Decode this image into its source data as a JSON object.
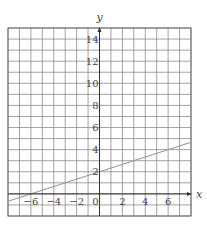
{
  "chart_data": {
    "type": "line",
    "title": "",
    "xlabel": "x",
    "ylabel": "y",
    "xlim": [
      -8,
      8
    ],
    "ylim": [
      -2,
      15
    ],
    "grid": true,
    "grid_step": 1,
    "x_ticks": [
      -6,
      -4,
      -2,
      0,
      2,
      4,
      6
    ],
    "x_tick_labels": [
      "−6",
      "−4",
      "−2",
      "0",
      "2",
      "4",
      "6"
    ],
    "y_ticks": [
      2,
      4,
      6,
      8,
      10,
      12,
      14
    ],
    "y_tick_labels": [
      "2",
      "4",
      "6",
      "8",
      "10",
      "12",
      "14"
    ],
    "series": [
      {
        "name": "y = x/3 + 2",
        "slope": 0.3333,
        "intercept": 2,
        "x": [
          -8,
          8
        ],
        "values": [
          -0.667,
          4.667
        ],
        "color": "#9a9a9a"
      }
    ]
  }
}
